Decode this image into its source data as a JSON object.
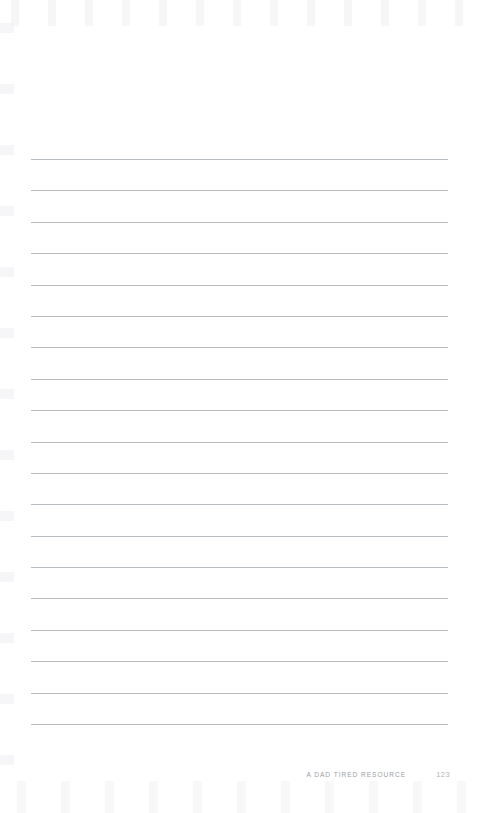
{
  "page": {
    "background_color": "#ffffff",
    "width": 489,
    "height": 813
  },
  "ruled_lines": {
    "count": 19,
    "color": "#b7bcc0",
    "left_margin": 31,
    "right_margin": 41,
    "first_line_y": 159,
    "spacing": 31.4,
    "thickness": 1
  },
  "footer": {
    "label": "A DAD TIRED RESOURCE",
    "page_number": "123",
    "label_color": "#9a9ea6",
    "page_number_color": "#acb0b6"
  }
}
